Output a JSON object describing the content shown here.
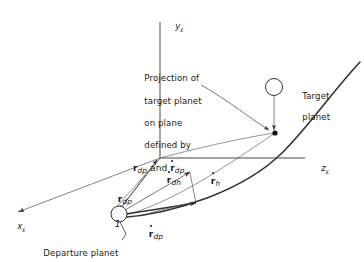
{
  "figure": {
    "kind": "orbital-transfer-geometry-diagram",
    "background_color": "#ffffff",
    "stroke_color": "#333333",
    "text_color": "#1a1a1a"
  },
  "axes": {
    "y": {
      "label": "y",
      "subscript": "ε",
      "name": "y-axis"
    },
    "z": {
      "label": "z",
      "subscript": "ε",
      "name": "z-axis"
    },
    "x": {
      "label": "x",
      "subscript": "ε",
      "name": "x-axis"
    }
  },
  "callout": {
    "line1": "Projection of",
    "line2": "target planet",
    "line3": "on plane",
    "line4": "defined by",
    "vec1_symbol": "r",
    "vec1_sub": "dp",
    "conjunction": "and",
    "vec2_symbol": "r",
    "vec2_sub": "dp"
  },
  "labels": {
    "target_planet_line1": "Target",
    "target_planet_line2": "planet",
    "departure_planet": "Departure planet",
    "node_number": "1"
  },
  "vectors": [
    {
      "name": "r-dp",
      "symbol": "r",
      "subscript": "dp",
      "dotted": false
    },
    {
      "name": "rdot-dh",
      "symbol": "r",
      "subscript": "dh",
      "dotted": true
    },
    {
      "name": "rdot-h",
      "symbol": "r",
      "subscript": "h",
      "dotted": true
    },
    {
      "name": "rdot-dp",
      "symbol": "r",
      "subscript": "dp",
      "dotted": true
    }
  ]
}
